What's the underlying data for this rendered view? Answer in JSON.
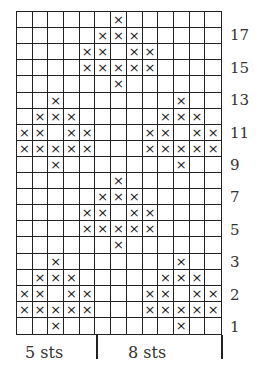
{
  "chart": {
    "columns": 13,
    "rows": 20,
    "stitch_symbol": "×",
    "grid_color": "#222222",
    "pattern": [
      "......X......",
      ".....XXX.....",
      "....XX.XX....",
      "....XXXXX....",
      "......X......",
      "..X.......X..",
      ".XXX.....XXX.",
      "XX.XX...XX.XX",
      "XXXXX...XXXXX",
      "..X.......X..",
      "......X......",
      ".....XXX.....",
      "....XX.XX....",
      "....XXXXX....",
      "......X......",
      "..X.......X..",
      ".XXX.....XXX.",
      "XX.XX...XX.XX",
      "XXXXX...XXXXX",
      "..X.......X.."
    ],
    "row_labels": [
      {
        "row": 1,
        "label": "17"
      },
      {
        "row": 3,
        "label": "15"
      },
      {
        "row": 5,
        "label": "13"
      },
      {
        "row": 7,
        "label": "11"
      },
      {
        "row": 9,
        "label": "9"
      },
      {
        "row": 11,
        "label": "7"
      },
      {
        "row": 13,
        "label": "5"
      },
      {
        "row": 15,
        "label": "3"
      },
      {
        "row": 17,
        "label": "2"
      },
      {
        "row": 19,
        "label": "1"
      }
    ]
  },
  "repeat": {
    "left_label": "5 sts",
    "right_label": "8 sts"
  }
}
